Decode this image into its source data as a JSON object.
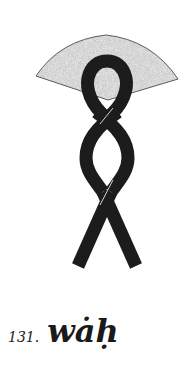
{
  "figure": {
    "number": "131.",
    "word": "wȧḥ",
    "glyph": {
      "name": "wah-hieroglyph",
      "parts": [
        "fan-shape",
        "twisted-loop-cord"
      ],
      "colors": {
        "fan_fill": "#d6d6d6",
        "fan_stroke": "#555555",
        "cord": "#1c1c1c",
        "background": "#ffffff"
      }
    }
  }
}
